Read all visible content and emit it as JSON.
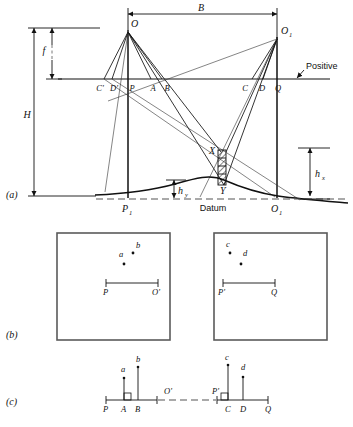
{
  "figure": {
    "panels": [
      {
        "tag": "(a)",
        "name": "vertical-section"
      },
      {
        "tag": "(b)",
        "name": "photo-pair"
      },
      {
        "tag": "(c)",
        "name": "parallax-bar-line"
      }
    ]
  },
  "panel_a": {
    "tag": "(a)",
    "dimensions": {
      "base": "B",
      "focal_length": "f",
      "flying_height": "H",
      "height_x": "h",
      "height_x_sub": "x",
      "height_y": "h",
      "height_y_sub": "y"
    },
    "stations": {
      "left_camera": "O",
      "right_camera": "O",
      "right_camera_sub": "1",
      "left_ground": "P",
      "left_ground_sub": "1",
      "right_ground": "O",
      "right_ground_sub": "1"
    },
    "image_points": {
      "c_prime": "C'",
      "d_prime": "D'",
      "p": "P",
      "a": "A",
      "b": "B",
      "c": "C",
      "d": "D",
      "q": "Q"
    },
    "object_points": {
      "upper": "X",
      "lower": "Y"
    },
    "labels": {
      "positive": "Positive",
      "datum": "Datum"
    }
  },
  "panel_b": {
    "tag": "(b)",
    "left_photo": {
      "name": "left-photograph",
      "points": [
        {
          "label": "a",
          "x": 119,
          "y": 269
        },
        {
          "label": "b",
          "x": 133,
          "y": 262
        }
      ],
      "baseline": {
        "left_label": "P",
        "right_label": "O'"
      }
    },
    "right_photo": {
      "name": "right-photograph",
      "points": [
        {
          "label": "c",
          "x": 230,
          "y": 262
        },
        {
          "label": "d",
          "x": 244,
          "y": 268
        }
      ],
      "baseline": {
        "left_label": "P'",
        "right_label": "Q"
      }
    }
  },
  "panel_c": {
    "tag": "(c)",
    "left_segment": {
      "axis_labels": [
        "P",
        "A",
        "B"
      ],
      "marker_labels": [
        "a",
        "b"
      ],
      "end_label": "O'"
    },
    "right_segment": {
      "axis_labels": [
        "C",
        "D",
        "Q"
      ],
      "marker_labels": [
        "c",
        "d"
      ],
      "start_label": "P'"
    }
  },
  "colors": {
    "ink": "#111111",
    "frame": "#5a5a5a",
    "dash": "#555555",
    "paper": "#ffffff"
  }
}
